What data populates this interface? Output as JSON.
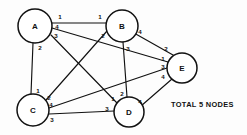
{
  "diagram": {
    "type": "undirected-graph",
    "caption": "TOTAL 5 NODES",
    "caption_position": {
      "x": 171,
      "y": 100
    },
    "stroke_color": "#111111",
    "node_fill": "#ffffff",
    "background": "#fdfdfd",
    "nodes": [
      {
        "id": "A",
        "label": "A",
        "cx": 35,
        "cy": 26,
        "r": 17
      },
      {
        "id": "B",
        "label": "B",
        "cx": 122,
        "cy": 26,
        "r": 16
      },
      {
        "id": "C",
        "label": "C",
        "cx": 33,
        "cy": 110,
        "r": 16
      },
      {
        "id": "D",
        "label": "D",
        "cx": 129,
        "cy": 112,
        "r": 15
      },
      {
        "id": "E",
        "label": "E",
        "cx": 182,
        "cy": 68,
        "r": 15
      }
    ],
    "edges": [
      {
        "id": "A-B",
        "from": "A",
        "to": "B",
        "from_port": "1",
        "to_port": "1",
        "x1": 52,
        "y1": 23,
        "x2": 106,
        "y2": 23,
        "from_label": {
          "x": 60,
          "y": 16,
          "text": "1"
        },
        "to_label": {
          "x": 100,
          "y": 16,
          "text": "1"
        }
      },
      {
        "id": "A-E",
        "from": "A",
        "to": "E",
        "from_port": "4",
        "to_port": "1",
        "x1": 52,
        "y1": 28,
        "x2": 168,
        "y2": 62,
        "from_label": {
          "x": 57,
          "y": 26,
          "text": "4"
        },
        "to_label": {
          "x": 163,
          "y": 58,
          "text": "1"
        }
      },
      {
        "id": "A-D",
        "from": "A",
        "to": "D",
        "from_port": "3",
        "to_port": "1",
        "x1": 51,
        "y1": 35,
        "x2": 117,
        "y2": 103,
        "from_label": {
          "x": 56,
          "y": 35,
          "text": "3"
        },
        "to_label": {
          "x": 113,
          "y": 98,
          "text": "1"
        }
      },
      {
        "id": "A-C",
        "from": "A",
        "to": "C",
        "from_port": "2",
        "to_port": "1",
        "x1": 33,
        "y1": 43,
        "x2": 31,
        "y2": 94,
        "from_label": {
          "x": 40,
          "y": 47,
          "text": "2"
        },
        "to_label": {
          "x": 38,
          "y": 90,
          "text": "1"
        }
      },
      {
        "id": "B-C",
        "from": "B",
        "to": "C",
        "from_port": "2",
        "to_port": "2",
        "x1": 107,
        "y1": 31,
        "x2": 46,
        "y2": 100,
        "from_label": {
          "x": 103,
          "y": 35,
          "text": "2"
        },
        "to_label": {
          "x": 49,
          "y": 97,
          "text": "2"
        }
      },
      {
        "id": "B-E",
        "from": "B",
        "to": "E",
        "from_port": "4",
        "to_port": "2",
        "x1": 134,
        "y1": 33,
        "x2": 173,
        "y2": 55,
        "from_label": {
          "x": 140,
          "y": 31,
          "text": "4"
        },
        "to_label": {
          "x": 166,
          "y": 48,
          "text": "2"
        }
      },
      {
        "id": "B-D",
        "from": "B",
        "to": "D",
        "from_port": "3",
        "to_port": "2",
        "x1": 123,
        "y1": 42,
        "x2": 127,
        "y2": 97,
        "from_label": {
          "x": 128,
          "y": 48,
          "text": "3"
        },
        "to_label": {
          "x": 122,
          "y": 93,
          "text": "2"
        }
      },
      {
        "id": "C-E",
        "from": "C",
        "to": "E",
        "from_port": "4",
        "to_port": "3",
        "x1": 49,
        "y1": 108,
        "x2": 167,
        "y2": 68,
        "from_label": {
          "x": 51,
          "y": 104,
          "text": "4"
        },
        "to_label": {
          "x": 163,
          "y": 66,
          "text": "3"
        }
      },
      {
        "id": "C-D",
        "from": "C",
        "to": "D",
        "from_port": "3",
        "to_port": "3",
        "x1": 49,
        "y1": 114,
        "x2": 114,
        "y2": 111,
        "from_label": {
          "x": 52,
          "y": 119,
          "text": "3"
        },
        "to_label": {
          "x": 107,
          "y": 108,
          "text": "3"
        }
      },
      {
        "id": "D-E",
        "from": "D",
        "to": "E",
        "from_port": "4",
        "to_port": "4",
        "x1": 141,
        "y1": 106,
        "x2": 172,
        "y2": 79,
        "from_label": {
          "x": 140,
          "y": 101,
          "text": "4"
        },
        "to_label": {
          "x": 163,
          "y": 76,
          "text": "4"
        }
      }
    ]
  }
}
